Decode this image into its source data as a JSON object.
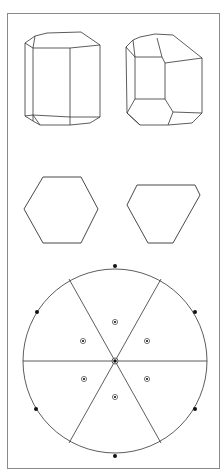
{
  "figure": {
    "colors": {
      "line": "#333333",
      "frame": "#888888",
      "background": "#ffffff"
    }
  },
  "panels": [
    {
      "id": "crystal-prism-habit",
      "label": ""
    },
    {
      "id": "crystal-truncated-habit",
      "label": ""
    },
    {
      "id": "regular-hexagon-section",
      "label": ""
    },
    {
      "id": "trigonal-hexagon-section",
      "label": ""
    },
    {
      "id": "stereographic-projection",
      "label": ""
    }
  ],
  "stereogram": {
    "mirror_lines": 3,
    "rim_poles": 6,
    "inner_poles": 6,
    "center_pole": 1
  }
}
